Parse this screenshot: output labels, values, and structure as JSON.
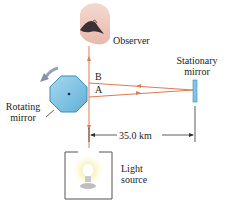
{
  "diagram": {
    "labels": {
      "observer": "Observer",
      "stationary_mirror_line1": "Stationary",
      "stationary_mirror_line2": "mirror",
      "rotating_mirror_line1": "Rotating",
      "rotating_mirror_line2": "mirror",
      "light_source_line1": "Light",
      "light_source_line2": "source",
      "point_a": "A",
      "point_b": "B",
      "distance": "35.0 km"
    },
    "colors": {
      "beam": "#e07a50",
      "mirror_fill": "#7ec4e4",
      "mirror_stroke": "#3a8fbd",
      "box_stroke": "#555555",
      "dimension_line": "#333333",
      "rotation_arrow": "#9aa0b0",
      "bulb_glow": "#f7ee8a"
    },
    "icons": [
      "eye-icon",
      "octagonal-mirror-icon",
      "stationary-mirror-icon",
      "light-bulb-icon",
      "rotation-arrow-icon"
    ]
  }
}
